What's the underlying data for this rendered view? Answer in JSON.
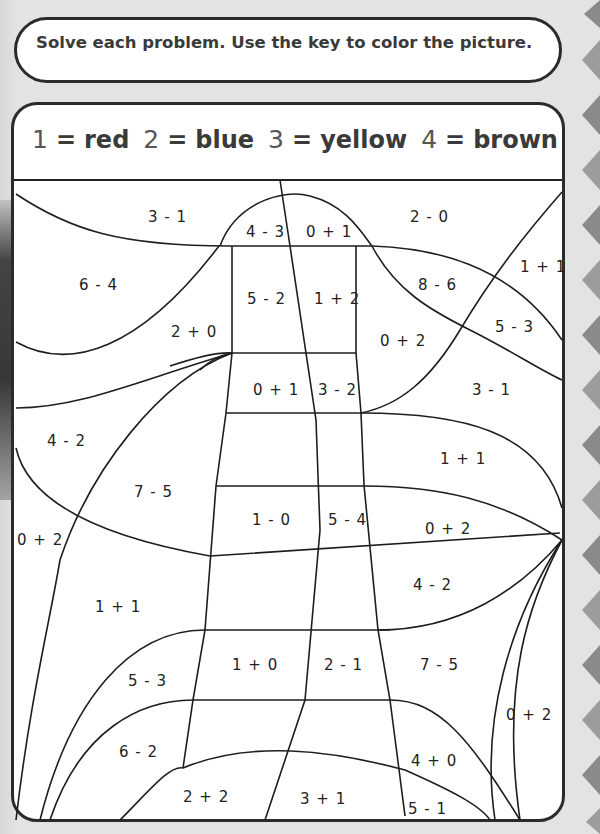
{
  "instructions": "Solve each problem. Use the key to color the picture.",
  "color_key": [
    {
      "number": "1",
      "color": "red"
    },
    {
      "number": "2",
      "color": "blue"
    },
    {
      "number": "3",
      "color": "yellow"
    },
    {
      "number": "4",
      "color": "brown"
    }
  ],
  "problems": [
    {
      "text": "3 - 1",
      "x": 148,
      "y": 208
    },
    {
      "text": "4 - 3",
      "x": 246,
      "y": 223
    },
    {
      "text": "0 + 1",
      "x": 306,
      "y": 223
    },
    {
      "text": "2 - 0",
      "x": 410,
      "y": 208
    },
    {
      "text": "6 - 4",
      "x": 79,
      "y": 276
    },
    {
      "text": "5 - 2",
      "x": 247,
      "y": 290
    },
    {
      "text": "1 + 2",
      "x": 314,
      "y": 290
    },
    {
      "text": "8 - 6",
      "x": 418,
      "y": 276
    },
    {
      "text": "1 + 1",
      "x": 520,
      "y": 258
    },
    {
      "text": "2 + 0",
      "x": 171,
      "y": 323
    },
    {
      "text": "0 + 2",
      "x": 380,
      "y": 332
    },
    {
      "text": "5 - 3",
      "x": 495,
      "y": 318
    },
    {
      "text": "0 + 1",
      "x": 253,
      "y": 381
    },
    {
      "text": "3 - 2",
      "x": 318,
      "y": 381
    },
    {
      "text": "3 - 1",
      "x": 472,
      "y": 381
    },
    {
      "text": "4 - 2",
      "x": 47,
      "y": 432
    },
    {
      "text": "1 + 1",
      "x": 440,
      "y": 450
    },
    {
      "text": "7 - 5",
      "x": 134,
      "y": 483
    },
    {
      "text": "1 - 0",
      "x": 252,
      "y": 511
    },
    {
      "text": "5 - 4",
      "x": 328,
      "y": 511
    },
    {
      "text": "0 + 2",
      "x": 425,
      "y": 520
    },
    {
      "text": "0 + 2",
      "x": 17,
      "y": 531
    },
    {
      "text": "4 - 2",
      "x": 413,
      "y": 576
    },
    {
      "text": "1 + 1",
      "x": 95,
      "y": 598
    },
    {
      "text": "1 + 0",
      "x": 232,
      "y": 656
    },
    {
      "text": "2 - 1",
      "x": 324,
      "y": 656
    },
    {
      "text": "7 - 5",
      "x": 420,
      "y": 656
    },
    {
      "text": "5 - 3",
      "x": 128,
      "y": 672
    },
    {
      "text": "0 + 2",
      "x": 506,
      "y": 706
    },
    {
      "text": "6 - 2",
      "x": 119,
      "y": 743
    },
    {
      "text": "4 + 0",
      "x": 411,
      "y": 752
    },
    {
      "text": "2 + 2",
      "x": 183,
      "y": 788
    },
    {
      "text": "3 + 1",
      "x": 300,
      "y": 790
    },
    {
      "text": "5 - 1",
      "x": 408,
      "y": 800
    }
  ],
  "colors": {
    "background": "#e3e3e3",
    "paper": "#ffffff",
    "border": "#2b2b2b",
    "text": "#3a3a3a",
    "chevron": "#8a8a8a"
  }
}
